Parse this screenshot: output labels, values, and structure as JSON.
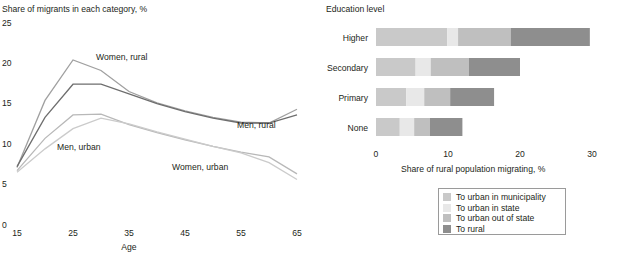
{
  "line_chart": {
    "y_axis_title": "Share of migrants in each category, %",
    "x_axis_title": "Age",
    "y_ticks": [
      "25",
      "20",
      "15",
      "10",
      "5",
      "0"
    ],
    "x_ticks": [
      "15",
      "25",
      "35",
      "45",
      "55",
      "65"
    ],
    "annotations": [
      {
        "label": "Women, rural",
        "x": 96,
        "y": 60
      },
      {
        "label": "Men, rural",
        "x": 237,
        "y": 128
      },
      {
        "label": "Men, urban",
        "x": 57,
        "y": 150
      },
      {
        "label": "Women, urban",
        "x": 172,
        "y": 170
      }
    ]
  },
  "bar_chart": {
    "title": "Education level",
    "x_axis_title": "Share of rural population migrating, %",
    "x_ticks": [
      "0",
      "10",
      "20",
      "30"
    ],
    "categories": [
      "Higher",
      "Secondary",
      "Primary",
      "None"
    ]
  },
  "legend": {
    "items": [
      {
        "label": "To urban in municipality",
        "color": "#c9c9c9"
      },
      {
        "label": "To urban in state",
        "color": "#e8e8e8"
      },
      {
        "label": "To urban out of state",
        "color": "#bfbfbf"
      },
      {
        "label": "To rural",
        "color": "#8e8e8e"
      }
    ]
  },
  "chart_data": [
    {
      "type": "line",
      "title": "Share of migrants in each category, %",
      "xlabel": "Age",
      "ylabel": "Share of migrants in each category, %",
      "xlim": [
        15,
        65
      ],
      "ylim": [
        0,
        25
      ],
      "x": [
        15,
        20,
        25,
        30,
        35,
        40,
        45,
        50,
        55,
        60,
        65
      ],
      "grid": false,
      "legend_position": "inline-annotations",
      "series": [
        {
          "name": "Women, rural",
          "color": "#a0a0a0",
          "values": [
            7.0,
            15.3,
            20.3,
            19.0,
            16.4,
            15.0,
            14.0,
            13.2,
            12.6,
            12.5,
            14.2
          ]
        },
        {
          "name": "Men, rural",
          "color": "#6e6e6e",
          "values": [
            7.1,
            13.2,
            17.3,
            17.3,
            16.1,
            14.9,
            13.9,
            13.1,
            12.5,
            12.5,
            13.5
          ]
        },
        {
          "name": "Men, urban",
          "color": "#b8b8b8",
          "values": [
            6.6,
            10.6,
            13.5,
            13.6,
            12.3,
            11.3,
            10.4,
            9.6,
            8.9,
            8.3,
            6.2
          ]
        },
        {
          "name": "Women, urban",
          "color": "#cbcbcb",
          "values": [
            6.4,
            9.3,
            11.8,
            13.1,
            12.4,
            11.4,
            10.5,
            9.6,
            8.8,
            7.6,
            5.5
          ]
        }
      ]
    },
    {
      "type": "bar",
      "orientation": "horizontal",
      "stacked": true,
      "title": "Education level",
      "xlabel": "Share of rural population migrating, %",
      "ylabel": "Education level",
      "xlim": [
        0,
        30
      ],
      "categories": [
        "Higher",
        "Secondary",
        "Primary",
        "None"
      ],
      "series": [
        {
          "name": "To urban in municipality",
          "color": "#c9c9c9",
          "values": [
            9.9,
            5.5,
            4.2,
            3.3
          ]
        },
        {
          "name": "To urban in state",
          "color": "#e8e8e8",
          "values": [
            1.5,
            2.1,
            2.5,
            2.0
          ]
        },
        {
          "name": "To urban out of state",
          "color": "#bfbfbf",
          "values": [
            7.3,
            5.3,
            3.6,
            2.2
          ]
        },
        {
          "name": "To rural",
          "color": "#8e8e8e",
          "values": [
            11.0,
            7.1,
            6.1,
            4.5
          ]
        }
      ],
      "totals": [
        29.7,
        20.0,
        16.4,
        12.0
      ]
    }
  ]
}
